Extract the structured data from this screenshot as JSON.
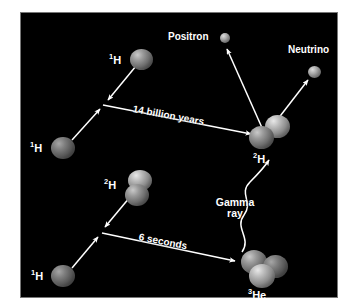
{
  "figure": {
    "background_color": "#000000",
    "page_color": "#ffffff",
    "arrow_color": "#ffffff",
    "text_color": "#ffffff"
  },
  "reactions": [
    {
      "id": "reaction-1",
      "duration_label": "14 billion years",
      "reactants": [
        {
          "id": "h1-top",
          "label_html": "<sup>1</sup>H",
          "label_text": "1H"
        },
        {
          "id": "h1-left",
          "label_html": "<sup>1</sup>H",
          "label_text": "1H"
        }
      ],
      "products": [
        {
          "id": "deuterium",
          "label_html": "<sup>2</sup>H",
          "label_text": "2H"
        },
        {
          "id": "positron",
          "label_html": "Positron",
          "label_text": "Positron"
        },
        {
          "id": "neutrino",
          "label_html": "Neutrino",
          "label_text": "Neutrino"
        }
      ]
    },
    {
      "id": "reaction-2",
      "duration_label": "6 seconds",
      "reactants": [
        {
          "id": "h2-top",
          "label_html": "<sup>2</sup>H",
          "label_text": "2H"
        },
        {
          "id": "h1-bottom",
          "label_html": "<sup>1</sup>H",
          "label_text": "1H"
        }
      ],
      "products": [
        {
          "id": "helium3",
          "label_html": "<sup>3</sup>He",
          "label_text": "3He"
        },
        {
          "id": "gamma",
          "label_line1": "Gamma",
          "label_line2": "ray",
          "label_text": "Gamma ray"
        }
      ]
    }
  ],
  "labels": {
    "positron": "Positron",
    "neutrino": "Neutrino",
    "gamma_line1": "Gamma",
    "gamma_line2": "ray",
    "time_1": "14 billion years",
    "time_2": "6 seconds",
    "h1_top": "H",
    "h1_top_sup": "1",
    "h1_left": "H",
    "h1_left_sup": "1",
    "deuterium": "H",
    "deuterium_sup": "2",
    "h2_top": "H",
    "h2_top_sup": "2",
    "h1_bottom": "H",
    "h1_bottom_sup": "1",
    "helium3": "He",
    "helium3_sup": "3"
  }
}
